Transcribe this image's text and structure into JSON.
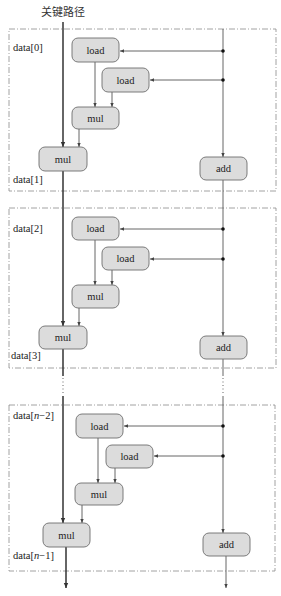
{
  "title": "关键路径",
  "colors": {
    "node_fill": "#dcdcdc",
    "node_stroke": "#6e6e6e",
    "line": "#555555",
    "critical_line": "#333333",
    "dashed_box": "#8a8a8a"
  },
  "iterations": [
    {
      "top_label": "data[0]",
      "bottom_label": "data[1]",
      "box": {
        "x": 9,
        "y": 29,
        "w": 267,
        "h": 162
      },
      "nodes": [
        {
          "id": "load1",
          "label": "load",
          "x": 72,
          "y": 38,
          "w": 47,
          "h": 24
        },
        {
          "id": "load2",
          "label": "load",
          "x": 102,
          "y": 68,
          "w": 47,
          "h": 24
        },
        {
          "id": "mul1",
          "label": "mul",
          "x": 72,
          "y": 107,
          "w": 47,
          "h": 22
        },
        {
          "id": "mul2",
          "label": "mul",
          "x": 39,
          "y": 147,
          "w": 48,
          "h": 24
        },
        {
          "id": "add",
          "label": "add",
          "x": 200,
          "y": 157,
          "w": 47,
          "h": 23
        }
      ]
    },
    {
      "top_label": "data[2]",
      "bottom_label": "data[3]",
      "box": {
        "x": 9,
        "y": 208,
        "w": 267,
        "h": 160
      },
      "nodes": [
        {
          "id": "load1",
          "label": "load",
          "x": 72,
          "y": 217,
          "w": 47,
          "h": 23
        },
        {
          "id": "load2",
          "label": "load",
          "x": 102,
          "y": 247,
          "w": 47,
          "h": 23
        },
        {
          "id": "mul1",
          "label": "mul",
          "x": 72,
          "y": 285,
          "w": 47,
          "h": 23
        },
        {
          "id": "mul2",
          "label": "mul",
          "x": 39,
          "y": 326,
          "w": 48,
          "h": 23
        },
        {
          "id": "add",
          "label": "add",
          "x": 200,
          "y": 336,
          "w": 47,
          "h": 23
        }
      ]
    },
    {
      "top_label_prefix": "data[",
      "top_label_var": "n",
      "top_label_suffix": "−2]",
      "bottom_label_prefix": "data[",
      "bottom_label_var": "n",
      "bottom_label_suffix": "−1]",
      "box": {
        "x": 9,
        "y": 405,
        "w": 266,
        "h": 166
      },
      "nodes": [
        {
          "id": "load1",
          "label": "load",
          "x": 76,
          "y": 414,
          "w": 47,
          "h": 24
        },
        {
          "id": "load2",
          "label": "load",
          "x": 106,
          "y": 445,
          "w": 47,
          "h": 23
        },
        {
          "id": "mul1",
          "label": "mul",
          "x": 75,
          "y": 483,
          "w": 48,
          "h": 22
        },
        {
          "id": "mul2",
          "label": "mul",
          "x": 43,
          "y": 523,
          "w": 47,
          "h": 24
        },
        {
          "id": "add",
          "label": "add",
          "x": 203,
          "y": 533,
          "w": 47,
          "h": 23
        }
      ]
    }
  ]
}
